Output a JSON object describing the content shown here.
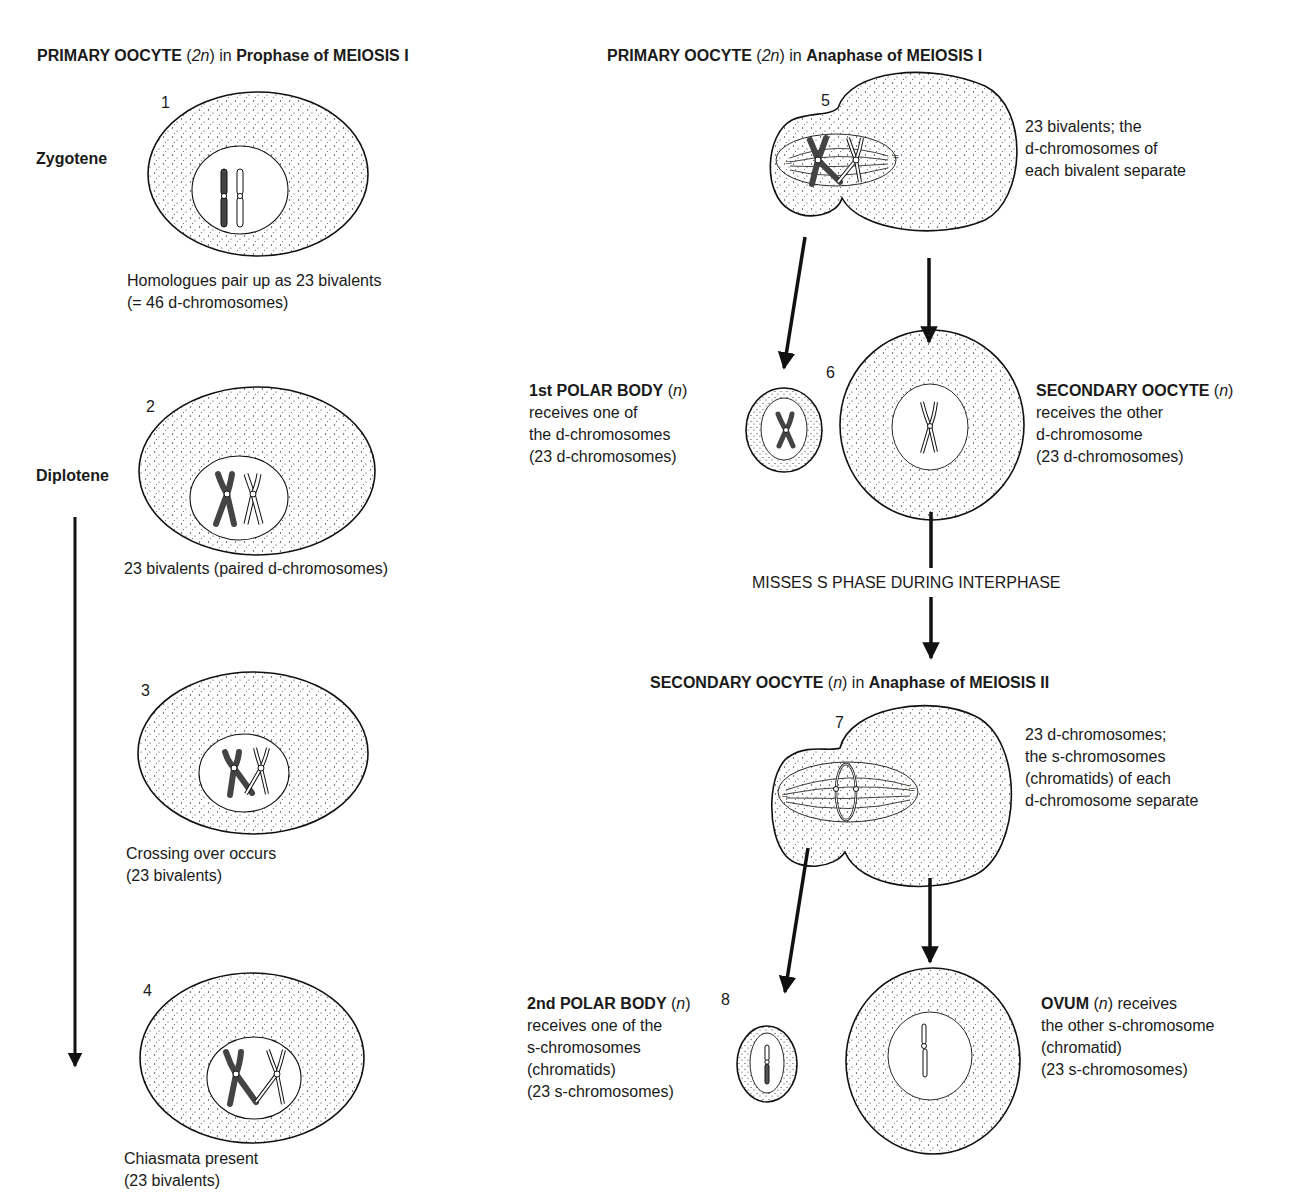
{
  "left_column": {
    "header": {
      "bold1": "PRIMARY OOCYTE",
      "mid": " (",
      "italic": "2n",
      "mid2": ") in ",
      "bold2": "Prophase of MEIOSIS I"
    },
    "cells": [
      {
        "number": "1",
        "stage": "Zygotene",
        "caption": [
          "Homologues pair up as 23 bivalents",
          "(= 46 d-chromosomes)"
        ]
      },
      {
        "number": "2",
        "stage": "Diplotene",
        "caption": [
          "23 bivalents (paired d-chromosomes)"
        ]
      },
      {
        "number": "3",
        "stage": "",
        "caption": [
          "Crossing over occurs",
          "(23 bivalents)"
        ]
      },
      {
        "number": "4",
        "stage": "",
        "caption": [
          "Chiasmata present",
          "(23 bivalents)"
        ]
      }
    ]
  },
  "right_column": {
    "header1": {
      "bold1": "PRIMARY OOCYTE",
      "mid": " (",
      "italic": "2n",
      "mid2": ") in ",
      "bold2": "Anaphase of MEIOSIS I"
    },
    "cell5": {
      "number": "5",
      "caption": [
        "23 bivalents; the",
        "d-chromosomes of",
        "each bivalent separate"
      ]
    },
    "cell6": {
      "number": "6",
      "polar_body": {
        "title": "1st POLAR BODY",
        "italic": "n",
        "lines": [
          "receives one of",
          "the d-chromosomes",
          "(23 d-chromosomes)"
        ]
      },
      "secondary_oocyte": {
        "title": "SECONDARY OOCYTE",
        "italic": "n",
        "lines": [
          "receives the other",
          "d-chromosome",
          "(23 d-chromosomes)"
        ]
      }
    },
    "interphase_label": "MISSES S PHASE DURING INTERPHASE",
    "header2": {
      "bold1": "SECONDARY OOCYTE",
      "mid": " (",
      "italic": "n",
      "mid2": ") in ",
      "bold2": "Anaphase of MEIOSIS II"
    },
    "cell7": {
      "number": "7",
      "caption": [
        "23 d-chromosomes;",
        "the s-chromosomes",
        "(chromatids) of each",
        "d-chromosome separate"
      ]
    },
    "cell8": {
      "number": "8",
      "polar_body": {
        "title": "2nd POLAR BODY",
        "italic": "n",
        "lines": [
          "receives one of the",
          "s-chromosomes",
          "(chromatids)",
          "(23 s-chromosomes)"
        ]
      },
      "ovum": {
        "title": "OVUM",
        "italic": "n",
        "after": " receives",
        "lines": [
          "the other s-chromosome",
          "(chromatid)",
          "(23 s-chromosomes)"
        ]
      }
    }
  },
  "colors": {
    "ink": "#1a1a1a",
    "chromosome_dark": "#444444",
    "background": "#ffffff"
  }
}
